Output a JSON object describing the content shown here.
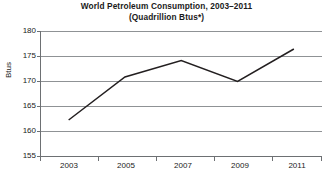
{
  "chart_data": {
    "type": "line",
    "title": "World Petroleum Consumption, 2003–2011",
    "subtitle": "(Quadrillion Btus*)",
    "title_line1": "World Petroleum Consumption, 2003–2011",
    "title_line2": "(Quadrillion Btus*)",
    "xlabel": "",
    "ylabel": "Btus",
    "x": [
      2003,
      2005,
      2007,
      2009,
      2011
    ],
    "values": [
      162.3,
      170.9,
      174.2,
      170.0,
      176.5
    ],
    "series": [
      {
        "name": "World Petroleum Consumption",
        "values": [
          162.3,
          170.9,
          174.2,
          170.0,
          176.5
        ]
      }
    ],
    "xlim": [
      2002,
      2012
    ],
    "ylim": [
      155,
      180
    ],
    "y_ticks": [
      180,
      175,
      170,
      165,
      160,
      155
    ],
    "y_tick_labels": [
      "180",
      "175",
      "170",
      "165",
      "160",
      "155"
    ],
    "x_ticks": [
      2003,
      2005,
      2007,
      2009,
      2011
    ],
    "x_tick_labels": [
      "2003",
      "2005",
      "2007",
      "2009",
      "2011"
    ],
    "grid": "horizontal",
    "legend": "none",
    "line_color": "#231f20",
    "grid_color": "#8f9295",
    "background_color": "#ffffff"
  }
}
